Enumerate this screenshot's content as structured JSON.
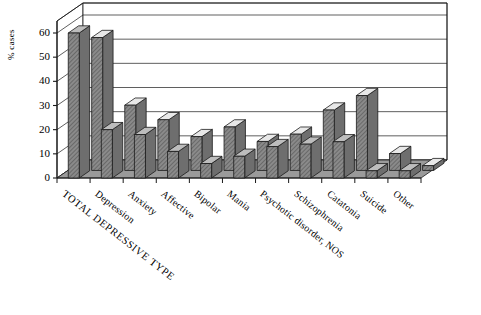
{
  "chart_data": {
    "type": "bar",
    "title": "",
    "xlabel": "",
    "ylabel": "% cases",
    "ylim": [
      0,
      65
    ],
    "yticks": [
      0,
      10,
      20,
      30,
      40,
      50,
      60
    ],
    "grid": true,
    "legend": "none",
    "three_d": true,
    "categories": [
      "TOTAL DEPRESSIVE TYPE",
      "Depression",
      "Anxiety",
      "Affective",
      "Bipolar",
      "Mania",
      "Psychotic disorder, NOS",
      "Schizophrenia",
      "Catatonia",
      "Suicide",
      "Other"
    ],
    "series": [
      {
        "name": "front",
        "fill": "#8a8a8a",
        "values": [
          60,
          20,
          18,
          11,
          6,
          9,
          13,
          14,
          15,
          3,
          3
        ]
      },
      {
        "name": "back",
        "fill": "#8a8a8a",
        "values": [
          55,
          27,
          21,
          14,
          18,
          12,
          15,
          25,
          31,
          7,
          2
        ]
      }
    ]
  },
  "axis": {
    "y_title": "% cases",
    "tick_labels": [
      "60",
      "50",
      "40",
      "30",
      "20",
      "10",
      "0"
    ]
  },
  "colors": {
    "bar_front": "#8a8a8a",
    "bar_top_light": "#e8e8e8",
    "bar_side": "#6e6e6e",
    "floor": "#9a9a9a",
    "wall": "#ffffff",
    "line": "#1a1a1a"
  }
}
